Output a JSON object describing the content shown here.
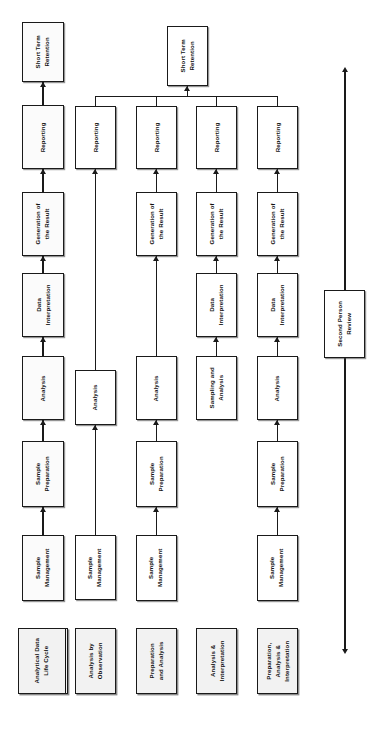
{
  "diagram": {
    "legend": {
      "split_box": {
        "left_label": "Analytical Data\nLife Cycle",
        "right_label": "Analysis Type"
      },
      "types": [
        "Analysis by\nObservation",
        "Preparation\nand Analysis",
        "Analysis &\nInterpretation",
        "Preparation,\nAnalysis &\nInterpretation"
      ]
    },
    "lifecycle_stages": [
      "Sample\nManagement",
      "Sample\nPreparation",
      "Analysis",
      "Data\nInterpretation",
      "Generation of\nthe Result",
      "Reporting",
      "Short Term\nRetention"
    ],
    "columns": [
      {
        "id": "lifecycle-reference",
        "header": "Analytical Data\nLife Cycle",
        "nodes": [
          "Sample\nManagement",
          "Sample\nPreparation",
          "Analysis",
          "Data\nInterpretation",
          "Generation of\nthe Result",
          "Reporting",
          "Short Term\nRetention"
        ]
      },
      {
        "id": "analysis-by-observation",
        "header": "Analysis by\nObservation",
        "nodes": [
          "Sample\nManagement",
          "Analysis",
          "Reporting"
        ]
      },
      {
        "id": "preparation-and-analysis",
        "header": "Preparation\nand Analysis",
        "nodes": [
          "Sample\nManagement",
          "Sample\nPreparation",
          "Analysis",
          "Generation of\nthe Result",
          "Reporting"
        ]
      },
      {
        "id": "analysis-and-interpretation",
        "header": "Analysis &\nInterpretation",
        "nodes": [
          "Sampling and\nAnalysis",
          "Data\nInterpretation",
          "Generation of\nthe Result",
          "Reporting"
        ]
      },
      {
        "id": "preparation-analysis-interpretation",
        "header": "Preparation,\nAnalysis &\nInterpretation",
        "nodes": [
          "Sample\nManagement",
          "Sample\nPreparation",
          "Analysis",
          "Data\nInterpretation",
          "Generation of\nthe Result",
          "Reporting"
        ]
      }
    ],
    "shared_retention_label": "Short Term\nRetention",
    "second_person_review": {
      "label": "Second Person\nReview",
      "arrow_style": "double-headed-vertical"
    },
    "colors": {
      "line": "#1a1a1a",
      "node_fill": "#fbfbfb",
      "header_fill": "#f2f2f2",
      "background": "#ffffff"
    }
  }
}
